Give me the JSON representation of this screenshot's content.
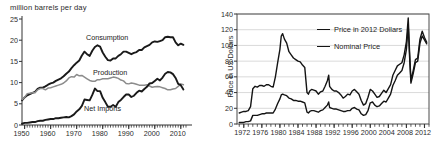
{
  "figure": {
    "background": "#ffffff",
    "ink": "#1a1a1a"
  },
  "charts": [
    {
      "id": "us-petroleum-supply",
      "position": "left"
    },
    {
      "id": "crude-oil-price",
      "position": "right"
    }
  ],
  "left": {
    "title": "million barrels per day",
    "y_ticks": [
      "0",
      "5",
      "10",
      "15",
      "20",
      "25"
    ],
    "x_ticks": [
      "1950",
      "1960",
      "1970",
      "1980",
      "1990",
      "2000",
      "2010"
    ],
    "series_labels": {
      "consumption": "Consumption",
      "production": "Production",
      "net_imports": "Net Imports"
    }
  },
  "right": {
    "ylabel": "Price in US Dollars",
    "y_ticks": [
      "0",
      "20",
      "40",
      "60",
      "80",
      "100",
      "120",
      "140"
    ],
    "x_ticks": [
      "1972",
      "1976",
      "1980",
      "1984",
      "1988",
      "1992",
      "1996",
      "2000",
      "2004",
      "2008",
      "2012"
    ],
    "legend": [
      {
        "label": "Price in 2012 Dollars",
        "color": "#141414"
      },
      {
        "label": "Nominal Price",
        "color": "#141414"
      }
    ]
  },
  "chart_data": [
    {
      "type": "line",
      "id": "us-petroleum-supply",
      "title": "million barrels per day",
      "xlabel": "",
      "ylabel": "million barrels per day",
      "xlim": [
        1949,
        2012
      ],
      "ylim": [
        0,
        25
      ],
      "xticks": [
        1950,
        1960,
        1970,
        1980,
        1990,
        2000,
        2010
      ],
      "yticks": [
        0,
        5,
        10,
        15,
        20,
        25
      ],
      "grid": false,
      "legend": "inline-annotations",
      "x": [
        1949,
        1950,
        1951,
        1952,
        1953,
        1954,
        1955,
        1956,
        1957,
        1958,
        1959,
        1960,
        1961,
        1962,
        1963,
        1964,
        1965,
        1966,
        1967,
        1968,
        1969,
        1970,
        1971,
        1972,
        1973,
        1974,
        1975,
        1976,
        1977,
        1978,
        1979,
        1980,
        1981,
        1982,
        1983,
        1984,
        1985,
        1986,
        1987,
        1988,
        1989,
        1990,
        1991,
        1992,
        1993,
        1994,
        1995,
        1996,
        1997,
        1998,
        1999,
        2000,
        2001,
        2002,
        2003,
        2004,
        2005,
        2006,
        2007,
        2008,
        2009,
        2010,
        2011
      ],
      "series": [
        {
          "name": "Consumption",
          "color": "#1a1a1a",
          "width": 1.9,
          "values": [
            5.8,
            6.5,
            7.0,
            7.3,
            7.6,
            7.8,
            8.5,
            8.8,
            8.8,
            9.1,
            9.5,
            9.8,
            10.0,
            10.4,
            10.7,
            11.0,
            11.5,
            12.1,
            12.6,
            13.4,
            14.1,
            14.7,
            15.2,
            16.4,
            17.3,
            16.7,
            16.3,
            17.5,
            18.4,
            18.8,
            18.5,
            17.1,
            16.1,
            15.3,
            15.2,
            15.7,
            15.7,
            16.3,
            16.7,
            17.3,
            17.3,
            17.0,
            16.7,
            17.0,
            17.2,
            17.7,
            17.7,
            18.3,
            18.6,
            18.9,
            19.5,
            19.7,
            19.6,
            19.8,
            20.0,
            20.7,
            20.8,
            20.7,
            20.7,
            19.5,
            18.8,
            19.2,
            18.9
          ]
        },
        {
          "name": "Production",
          "color": "#8c8c8c",
          "width": 1.5,
          "values": [
            6.0,
            6.5,
            7.4,
            7.5,
            7.6,
            7.6,
            8.3,
            8.6,
            8.6,
            8.3,
            8.7,
            8.8,
            9.0,
            9.2,
            9.4,
            9.6,
            9.9,
            10.4,
            11.1,
            11.4,
            11.3,
            11.9,
            11.6,
            11.7,
            11.3,
            10.9,
            10.5,
            10.3,
            10.3,
            10.7,
            10.7,
            10.9,
            10.9,
            10.9,
            11.1,
            11.3,
            11.2,
            11.0,
            10.6,
            10.4,
            9.8,
            9.7,
            9.9,
            9.8,
            9.6,
            9.4,
            9.4,
            9.4,
            9.5,
            9.2,
            8.9,
            9.0,
            9.1,
            9.0,
            8.8,
            8.6,
            8.3,
            8.3,
            8.5,
            8.6,
            9.1,
            9.7,
            9.5
          ]
        },
        {
          "name": "Net Imports",
          "color": "#1a1a1a",
          "width": 1.9,
          "values": [
            0.3,
            0.5,
            0.5,
            0.6,
            0.7,
            0.7,
            0.9,
            1.0,
            1.0,
            1.2,
            1.3,
            1.4,
            1.4,
            1.6,
            1.6,
            1.7,
            1.8,
            1.9,
            1.8,
            2.1,
            2.5,
            3.2,
            3.7,
            4.5,
            6.0,
            5.9,
            5.8,
            7.1,
            8.6,
            8.0,
            8.0,
            6.4,
            5.4,
            4.3,
            4.3,
            4.7,
            4.3,
            5.4,
            5.9,
            6.6,
            7.2,
            7.2,
            6.6,
            6.9,
            7.6,
            8.1,
            7.9,
            8.5,
            9.0,
            9.8,
            9.9,
            10.4,
            10.9,
            10.5,
            11.2,
            12.1,
            12.5,
            12.4,
            12.0,
            11.1,
            9.7,
            9.4,
            8.4
          ]
        }
      ]
    },
    {
      "type": "line",
      "id": "crude-oil-price",
      "title": "",
      "xlabel": "",
      "ylabel": "Price in US Dollars",
      "xlim": [
        1970.5,
        2013
      ],
      "ylim": [
        0,
        140
      ],
      "xticks": [
        1972,
        1976,
        1980,
        1984,
        1988,
        1992,
        1996,
        2000,
        2004,
        2008,
        2012
      ],
      "yticks": [
        0,
        20,
        40,
        60,
        80,
        100,
        120,
        140
      ],
      "grid": true,
      "legend_position": "upper-center",
      "x": [
        1971.0,
        1971.5,
        1972.0,
        1972.5,
        1973.0,
        1973.5,
        1974.0,
        1974.5,
        1975.0,
        1975.5,
        1976.0,
        1976.5,
        1977.0,
        1977.5,
        1978.0,
        1978.5,
        1979.0,
        1979.5,
        1980.0,
        1980.3,
        1980.6,
        1981.0,
        1981.5,
        1982.0,
        1982.5,
        1983.0,
        1983.5,
        1984.0,
        1984.5,
        1985.0,
        1985.5,
        1986.0,
        1986.3,
        1986.6,
        1987.0,
        1987.5,
        1988.0,
        1988.5,
        1989.0,
        1989.5,
        1990.0,
        1990.5,
        1990.8,
        1991.0,
        1991.5,
        1992.0,
        1992.5,
        1993.0,
        1993.5,
        1994.0,
        1994.5,
        1995.0,
        1995.5,
        1996.0,
        1996.5,
        1997.0,
        1997.5,
        1998.0,
        1998.5,
        1999.0,
        1999.5,
        2000.0,
        2000.5,
        2001.0,
        2001.5,
        2002.0,
        2002.5,
        2003.0,
        2003.5,
        2004.0,
        2004.5,
        2005.0,
        2005.5,
        2006.0,
        2006.5,
        2007.0,
        2007.5,
        2008.0,
        2008.4,
        2008.7,
        2009.0,
        2009.5,
        2010.0,
        2010.5,
        2011.0,
        2011.5,
        2012.0,
        2012.5
      ],
      "series": [
        {
          "name": "Price in 2012 Dollars",
          "color": "#141414",
          "width": 1.4,
          "values": [
            14,
            15,
            16,
            16,
            17,
            22,
            45,
            48,
            47,
            49,
            49,
            48,
            50,
            50,
            48,
            47,
            60,
            78,
            95,
            112,
            115,
            108,
            103,
            92,
            88,
            84,
            82,
            80,
            79,
            75,
            72,
            40,
            38,
            42,
            44,
            43,
            42,
            38,
            41,
            42,
            48,
            55,
            62,
            48,
            44,
            42,
            42,
            40,
            37,
            33,
            35,
            38,
            37,
            42,
            44,
            41,
            38,
            30,
            24,
            26,
            34,
            44,
            42,
            38,
            34,
            35,
            39,
            43,
            40,
            45,
            50,
            62,
            68,
            74,
            76,
            78,
            88,
            105,
            135,
            92,
            55,
            68,
            82,
            84,
            108,
            118,
            110,
            104
          ]
        },
        {
          "name": "Nominal Price",
          "color": "#141414",
          "width": 1.4,
          "values": [
            2,
            2,
            2,
            3,
            3,
            4,
            11,
            11,
            11,
            12,
            13,
            13,
            14,
            14,
            14,
            14,
            19,
            26,
            32,
            37,
            38,
            37,
            36,
            33,
            32,
            30,
            30,
            29,
            29,
            28,
            27,
            15,
            14,
            16,
            17,
            17,
            16,
            15,
            17,
            18,
            21,
            24,
            28,
            21,
            20,
            19,
            19,
            18,
            17,
            16,
            16,
            17,
            17,
            20,
            21,
            19,
            18,
            13,
            11,
            12,
            17,
            27,
            28,
            24,
            22,
            23,
            26,
            29,
            28,
            33,
            38,
            49,
            55,
            62,
            65,
            68,
            78,
            95,
            125,
            86,
            52,
            64,
            78,
            80,
            103,
            112,
            107,
            102
          ]
        }
      ]
    }
  ]
}
